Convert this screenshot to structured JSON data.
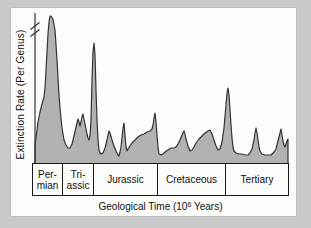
{
  "colors": {
    "page_background": "#c9c9c9",
    "panel_background": "#fcfcfb",
    "area_fill": "#b2b2b2",
    "area_stroke": "#333333",
    "band_border": "#1a1a1a",
    "ink": "#111111"
  },
  "y_axis": {
    "label": "Extinction Rate (Per Genus)",
    "has_scale_break": true
  },
  "x_axis": {
    "title_pre": "Geological Time (10",
    "title_sup": "6",
    "title_post": " Years)"
  },
  "chart_data": {
    "type": "area",
    "title": "",
    "xlabel": "Geological Time (10^6 Years)",
    "ylabel": "Extinction Rate (Per Genus)",
    "x_categories": [
      "Permian",
      "Triassic",
      "Jurassic",
      "Cretaceous",
      "Tertiary"
    ],
    "legend": "none",
    "grid": false,
    "baseline_y_px": 163.5,
    "plot_x_range_px": [
      35,
      288
    ],
    "periods": [
      {
        "label": "Per-\nmian",
        "x_start_px": 33,
        "x_end_px": 63
      },
      {
        "label": "Tri-\nassic",
        "x_start_px": 63,
        "x_end_px": 94
      },
      {
        "label": "Jurassic",
        "x_start_px": 94,
        "x_end_px": 158
      },
      {
        "label": "Cretaceous",
        "x_start_px": 158,
        "x_end_px": 226
      },
      {
        "label": "Tertiary",
        "x_start_px": 226,
        "x_end_px": 288
      }
    ],
    "curve_points_px": [
      [
        35,
        144
      ],
      [
        36,
        138
      ],
      [
        38,
        122
      ],
      [
        40,
        112
      ],
      [
        42,
        104
      ],
      [
        44,
        97
      ],
      [
        45,
        88
      ],
      [
        46,
        70
      ],
      [
        47,
        52
      ],
      [
        48,
        34
      ],
      [
        49,
        22
      ],
      [
        50,
        16
      ],
      [
        51,
        16
      ],
      [
        53,
        19
      ],
      [
        55,
        30
      ],
      [
        56,
        45
      ],
      [
        57,
        60
      ],
      [
        58,
        78
      ],
      [
        59,
        95
      ],
      [
        60,
        108
      ],
      [
        62,
        128
      ],
      [
        64,
        140
      ],
      [
        66,
        145
      ],
      [
        68,
        148
      ],
      [
        70,
        148
      ],
      [
        72,
        144
      ],
      [
        74,
        136
      ],
      [
        76,
        127
      ],
      [
        78,
        119
      ],
      [
        79,
        122
      ],
      [
        80,
        126
      ],
      [
        81,
        122
      ],
      [
        82,
        117
      ],
      [
        83,
        114
      ],
      [
        84,
        119
      ],
      [
        85,
        124
      ],
      [
        86,
        129
      ],
      [
        87,
        134
      ],
      [
        88,
        138
      ],
      [
        89,
        140
      ],
      [
        90,
        136
      ],
      [
        91,
        120
      ],
      [
        92,
        80
      ],
      [
        93,
        52
      ],
      [
        94,
        43
      ],
      [
        95,
        55
      ],
      [
        96,
        90
      ],
      [
        97,
        120
      ],
      [
        98,
        140
      ],
      [
        99,
        150
      ],
      [
        100,
        153
      ],
      [
        101,
        154
      ],
      [
        103,
        153
      ],
      [
        105,
        148
      ],
      [
        107,
        140
      ],
      [
        109,
        131
      ],
      [
        110,
        133
      ],
      [
        112,
        140
      ],
      [
        114,
        146
      ],
      [
        116,
        151
      ],
      [
        118,
        155
      ],
      [
        119,
        156
      ],
      [
        120,
        152
      ],
      [
        121,
        147
      ],
      [
        122,
        138
      ],
      [
        123,
        128
      ],
      [
        124,
        123
      ],
      [
        125,
        135
      ],
      [
        126,
        147
      ],
      [
        127,
        151
      ],
      [
        128,
        149
      ],
      [
        130,
        146
      ],
      [
        132,
        143
      ],
      [
        135,
        140
      ],
      [
        138,
        137
      ],
      [
        141,
        135
      ],
      [
        144,
        134
      ],
      [
        147,
        132
      ],
      [
        150,
        131
      ],
      [
        152,
        129
      ],
      [
        153,
        125
      ],
      [
        154,
        118
      ],
      [
        155,
        113
      ],
      [
        156,
        122
      ],
      [
        157,
        135
      ],
      [
        158,
        147
      ],
      [
        159,
        154
      ],
      [
        161,
        155
      ],
      [
        163,
        154
      ],
      [
        165,
        152
      ],
      [
        168,
        150
      ],
      [
        171,
        148
      ],
      [
        174,
        148
      ],
      [
        176,
        147
      ],
      [
        178,
        144
      ],
      [
        180,
        140
      ],
      [
        182,
        135
      ],
      [
        184,
        131
      ],
      [
        185,
        134
      ],
      [
        186,
        139
      ],
      [
        188,
        146
      ],
      [
        190,
        151
      ],
      [
        192,
        150
      ],
      [
        194,
        147
      ],
      [
        196,
        143
      ],
      [
        199,
        139
      ],
      [
        202,
        136
      ],
      [
        205,
        133
      ],
      [
        208,
        131
      ],
      [
        210,
        130
      ],
      [
        212,
        134
      ],
      [
        214,
        140
      ],
      [
        216,
        146
      ],
      [
        218,
        150
      ],
      [
        220,
        149
      ],
      [
        222,
        142
      ],
      [
        224,
        128
      ],
      [
        226,
        105
      ],
      [
        227,
        93
      ],
      [
        228,
        88
      ],
      [
        229,
        95
      ],
      [
        230,
        110
      ],
      [
        231,
        125
      ],
      [
        232,
        138
      ],
      [
        233,
        147
      ],
      [
        234,
        151
      ],
      [
        236,
        153
      ],
      [
        239,
        154
      ],
      [
        242,
        154
      ],
      [
        245,
        155
      ],
      [
        248,
        155
      ],
      [
        250,
        153
      ],
      [
        252,
        149
      ],
      [
        254,
        140
      ],
      [
        255,
        133
      ],
      [
        256,
        128
      ],
      [
        257,
        133
      ],
      [
        258,
        140
      ],
      [
        259,
        147
      ],
      [
        260,
        151
      ],
      [
        262,
        154
      ],
      [
        265,
        155
      ],
      [
        268,
        155
      ],
      [
        271,
        155
      ],
      [
        274,
        152
      ],
      [
        276,
        149
      ],
      [
        278,
        141
      ],
      [
        280,
        133
      ],
      [
        281,
        129
      ],
      [
        282,
        135
      ],
      [
        283,
        141
      ],
      [
        284,
        145
      ],
      [
        285,
        147
      ],
      [
        286,
        144
      ],
      [
        287,
        141
      ],
      [
        288,
        139
      ]
    ]
  }
}
